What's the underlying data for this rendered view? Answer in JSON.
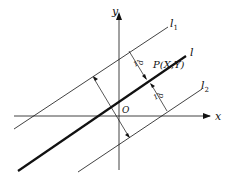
{
  "diagram": {
    "axes": {
      "x_label": "x",
      "y_label": "y",
      "origin_label": "O"
    },
    "lines": {
      "l1_label": "l",
      "l1_sub": "1",
      "l_label": "l",
      "l2_label": "l",
      "l2_sub": "2"
    },
    "point_label": "P(X,Y)",
    "distance_label_upper": "d",
    "distance_label_lower": "d",
    "tick_upper": "1",
    "tick_lower": "1",
    "colors": {
      "line": "#111111",
      "background": "#ffffff"
    }
  }
}
